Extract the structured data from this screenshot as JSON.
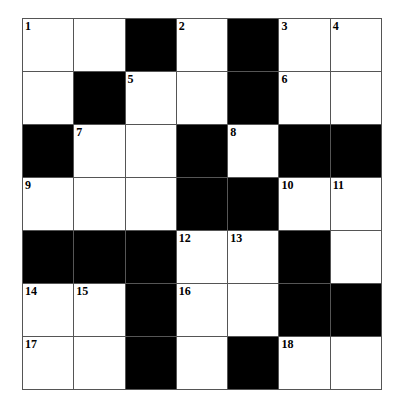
{
  "puzzle": {
    "rows": 7,
    "cols": 7,
    "grid": [
      [
        "1",
        "",
        "#",
        "2",
        "#",
        "3",
        "4"
      ],
      [
        "",
        "#",
        "5",
        "",
        "#",
        "6",
        ""
      ],
      [
        "#",
        "7",
        "",
        "#",
        "8",
        "#",
        "#"
      ],
      [
        "9",
        "",
        "",
        "#",
        "#",
        "10",
        "11"
      ],
      [
        "#",
        "#",
        "#",
        "12",
        "13",
        "#",
        ""
      ],
      [
        "14",
        "15",
        "#",
        "16",
        "",
        "#",
        "#"
      ],
      [
        "17",
        "",
        "#",
        "",
        "#",
        "18",
        ""
      ]
    ],
    "colors": {
      "block": "#000000",
      "cell": "#ffffff",
      "line": "#555555"
    }
  }
}
